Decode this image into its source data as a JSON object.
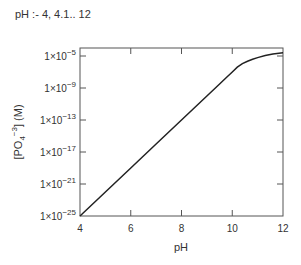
{
  "definition": {
    "text": "pH :- 4, 4.1..  12"
  },
  "chart_data": {
    "type": "line",
    "title": "",
    "xlabel": "pH",
    "ylabel": "[PO4^-3] (M)",
    "ylabel_parts": {
      "open": "[PO",
      "sub": "4",
      "sup": "−3",
      "close": "] (M)"
    },
    "xlim": [
      4,
      12
    ],
    "ylim_log10": [
      -25,
      -4
    ],
    "yscale": "log",
    "grid": false,
    "legend": null,
    "x_ticks": [
      {
        "value": 4,
        "label": "4"
      },
      {
        "value": 6,
        "label": "6"
      },
      {
        "value": 8,
        "label": "8"
      },
      {
        "value": 10,
        "label": "10"
      },
      {
        "value": 12,
        "label": "12"
      }
    ],
    "y_ticks": [
      {
        "log10": -5,
        "mant": "1×10",
        "exp": "−5"
      },
      {
        "log10": -9,
        "mant": "1×10",
        "exp": "−9"
      },
      {
        "log10": -13,
        "mant": "1×10",
        "exp": "−13"
      },
      {
        "log10": -17,
        "mant": "1×10",
        "exp": "−17"
      },
      {
        "log10": -21,
        "mant": "1×10",
        "exp": "−21"
      },
      {
        "log10": -25,
        "mant": "1×10",
        "exp": "−25"
      }
    ],
    "series": [
      {
        "name": "[PO4^-3]",
        "color": "#222222",
        "x": [
          4,
          5,
          6,
          7,
          8,
          9,
          9.5,
          9.8,
          10.0,
          10.2,
          10.4,
          10.6,
          10.8,
          11.0,
          11.3,
          11.6,
          12.0
        ],
        "log10_y": [
          -25.0,
          -22.0,
          -19.0,
          -16.0,
          -13.0,
          -10.0,
          -8.5,
          -7.6,
          -7.0,
          -6.4,
          -5.95,
          -5.65,
          -5.4,
          -5.2,
          -4.95,
          -4.75,
          -4.6
        ]
      }
    ]
  }
}
